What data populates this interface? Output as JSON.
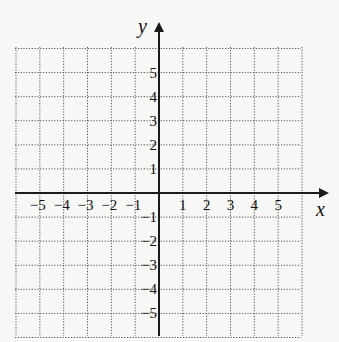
{
  "chart_data": {
    "type": "coordinate-grid",
    "title": "",
    "xlabel": "x",
    "ylabel": "y",
    "xlim": [
      -6,
      6
    ],
    "ylim": [
      -6,
      6
    ],
    "grid": true,
    "grid_style": "dotted",
    "x_ticks": [
      -5,
      -4,
      -3,
      -2,
      -1,
      1,
      2,
      3,
      4,
      5
    ],
    "y_ticks": [
      5,
      4,
      3,
      2,
      1,
      -1,
      -2,
      -3,
      -4,
      -5
    ],
    "x_tick_labels": [
      "−5",
      "−4",
      "−3",
      "−2",
      "−1",
      "1",
      "2",
      "3",
      "4",
      "5"
    ],
    "y_tick_labels": [
      "5",
      "4",
      "3",
      "2",
      "1",
      "−1",
      "−2",
      "−3",
      "−4",
      "−5"
    ],
    "arrows": [
      "positive-x",
      "positive-y"
    ]
  },
  "axes": {
    "x_label": "x",
    "y_label": "y"
  },
  "colors": {
    "background": "#f7f7f5",
    "grid": "#555555",
    "axis": "#1a1a1a"
  }
}
